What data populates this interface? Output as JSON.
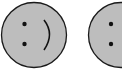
{
  "faces": [
    {
      "id": "face-left",
      "expression": "smile",
      "cx": 34,
      "cy": 35,
      "r": 33,
      "fill": "#bdbdbd",
      "stroke": "#1a1a1a"
    },
    {
      "id": "face-right",
      "expression": "neutral",
      "cx": 121,
      "cy": 35,
      "r": 33,
      "fill": "#bdbdbd",
      "stroke": "#1a1a1a"
    }
  ],
  "colors": {
    "background": "#ffffff",
    "face": "#bdbdbd",
    "outline": "#1a1a1a"
  }
}
